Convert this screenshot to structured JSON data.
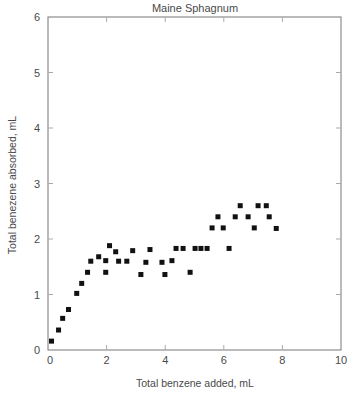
{
  "chart_data": {
    "type": "scatter",
    "title": "Maine Sphagnum",
    "xlabel": "Total benzene added, mL",
    "ylabel": "Total benezene absorbed, mL",
    "xlim": [
      0,
      10
    ],
    "ylim": [
      0,
      6
    ],
    "xticks": [
      0,
      2,
      4,
      6,
      8,
      10
    ],
    "yticks": [
      0,
      1,
      2,
      3,
      4,
      5,
      6
    ],
    "grid": false,
    "legend": null,
    "marker": "square",
    "series": [
      {
        "name": "Maine Sphagnum",
        "color": "#111111",
        "points": [
          [
            0.12,
            0.16
          ],
          [
            0.36,
            0.36
          ],
          [
            0.5,
            0.57
          ],
          [
            0.7,
            0.73
          ],
          [
            0.98,
            1.02
          ],
          [
            1.15,
            1.2
          ],
          [
            1.35,
            1.4
          ],
          [
            1.46,
            1.6
          ],
          [
            1.73,
            1.68
          ],
          [
            1.97,
            1.61
          ],
          [
            1.97,
            1.4
          ],
          [
            2.1,
            1.88
          ],
          [
            2.31,
            1.77
          ],
          [
            2.41,
            1.6
          ],
          [
            2.69,
            1.6
          ],
          [
            2.89,
            1.79
          ],
          [
            3.17,
            1.36
          ],
          [
            3.34,
            1.58
          ],
          [
            3.48,
            1.81
          ],
          [
            3.89,
            1.58
          ],
          [
            3.99,
            1.36
          ],
          [
            4.23,
            1.61
          ],
          [
            4.37,
            1.83
          ],
          [
            4.61,
            1.83
          ],
          [
            4.85,
            1.4
          ],
          [
            5.02,
            1.83
          ],
          [
            5.22,
            1.83
          ],
          [
            5.43,
            1.83
          ],
          [
            5.6,
            2.2
          ],
          [
            5.8,
            2.4
          ],
          [
            5.98,
            2.2
          ],
          [
            6.18,
            1.83
          ],
          [
            6.39,
            2.4
          ],
          [
            6.56,
            2.6
          ],
          [
            6.83,
            2.4
          ],
          [
            7.04,
            2.2
          ],
          [
            7.17,
            2.6
          ],
          [
            7.45,
            2.6
          ],
          [
            7.55,
            2.4
          ],
          [
            7.79,
            2.19
          ]
        ]
      }
    ]
  },
  "colors": {
    "axis": "#777777",
    "text": "#4a4a4a",
    "marker": "#111111",
    "background": "#ffffff"
  }
}
